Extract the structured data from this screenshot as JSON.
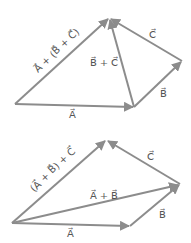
{
  "figures": [
    {
      "name": "associative-grouping-top",
      "labels": {
        "A": "A⃗",
        "B": "B⃗",
        "C": "C⃗",
        "BC": "B⃗ + C⃗",
        "sum": "A⃗ + (B⃗ + C⃗)"
      }
    },
    {
      "name": "associative-grouping-bottom",
      "labels": {
        "A": "A⃗",
        "B": "B⃗",
        "C": "C⃗",
        "AB": "A⃗ + B⃗",
        "sum": "(A⃗ + B⃗) + C⃗"
      }
    }
  ],
  "colors": {
    "vector": "#8c8c8c",
    "label": "#555555",
    "background": "#ffffff"
  }
}
